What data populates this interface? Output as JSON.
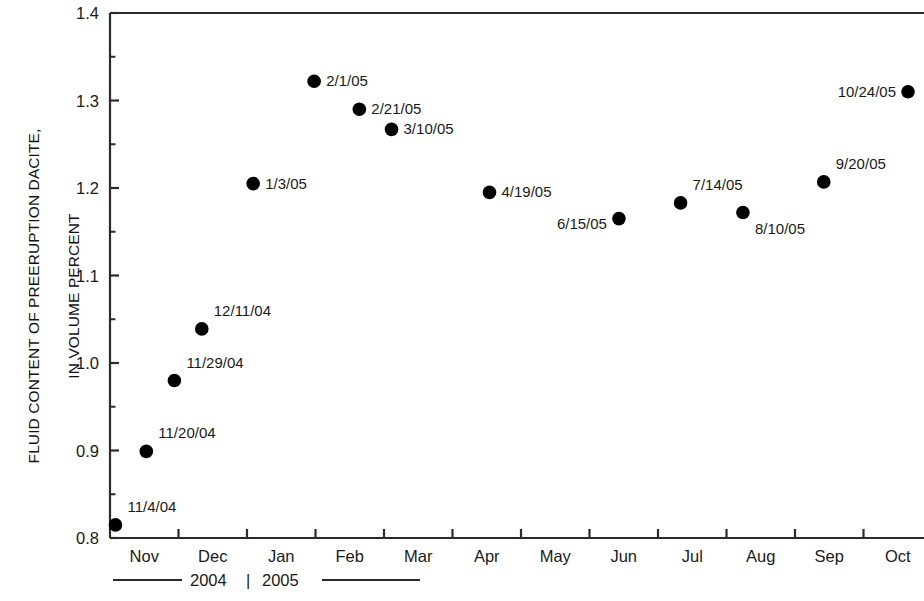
{
  "axes": {
    "y_title_line1": "FLUID CONTENT OF PREERUPTION DACITE,",
    "y_title_line2": "IN VOLUME PERCENT",
    "y_ticks": [
      "1.4",
      "1.3",
      "1.2",
      "1.1",
      "1.0",
      "0.9",
      "0.8"
    ],
    "x_ticks": [
      "Nov",
      "Dec",
      "Jan",
      "Feb",
      "Mar",
      "Apr",
      "May",
      "Jun",
      "Jul",
      "Aug",
      "Sep",
      "Oct"
    ],
    "year_left": "2004",
    "year_separator": "|",
    "year_right": "2005"
  },
  "chart_data": {
    "type": "scatter",
    "title": "",
    "xlabel": "",
    "ylabel": "FLUID CONTENT OF PREERUPTION DACITE, IN VOLUME PERCENT",
    "ylim": [
      0.8,
      1.4
    ],
    "y_major_step": 0.1,
    "y_minor_step": 0.05,
    "grid": false,
    "legend": false,
    "x_categories": [
      "Nov",
      "Dec",
      "Jan",
      "Feb",
      "Mar",
      "Apr",
      "May",
      "Jun",
      "Jul",
      "Aug",
      "Sep",
      "Oct"
    ],
    "x_year_spans": [
      "2004",
      "2005"
    ],
    "marker": {
      "shape": "circle",
      "color": "#000000",
      "size": 9
    },
    "points": [
      {
        "label": "11/4/04",
        "month": "Nov",
        "x": 0.08,
        "y": 0.815,
        "label_pos": "above-right"
      },
      {
        "label": "11/20/04",
        "month": "Nov",
        "x": 0.53,
        "y": 0.899,
        "label_pos": "above-right"
      },
      {
        "label": "11/29/04",
        "month": "Nov",
        "x": 0.94,
        "y": 0.98,
        "label_pos": "above-right"
      },
      {
        "label": "12/11/04",
        "month": "Dec",
        "x": 1.34,
        "y": 1.039,
        "label_pos": "above-right"
      },
      {
        "label": "1/3/05",
        "month": "Jan",
        "x": 2.09,
        "y": 1.205,
        "label_pos": "right"
      },
      {
        "label": "2/1/05",
        "month": "Feb",
        "x": 2.98,
        "y": 1.322,
        "label_pos": "right"
      },
      {
        "label": "2/21/05",
        "month": "Feb",
        "x": 3.64,
        "y": 1.29,
        "label_pos": "right"
      },
      {
        "label": "3/10/05",
        "month": "Mar",
        "x": 4.11,
        "y": 1.267,
        "label_pos": "right"
      },
      {
        "label": "4/19/05",
        "month": "Apr",
        "x": 5.54,
        "y": 1.195,
        "label_pos": "right"
      },
      {
        "label": "6/15/05",
        "month": "Jun",
        "x": 7.43,
        "y": 1.165,
        "label_pos": "below-left"
      },
      {
        "label": "7/14/05",
        "month": "Jul",
        "x": 8.33,
        "y": 1.183,
        "label_pos": "above-right"
      },
      {
        "label": "8/10/05",
        "month": "Aug",
        "x": 9.24,
        "y": 1.172,
        "label_pos": "below-right"
      },
      {
        "label": "9/20/05",
        "month": "Sep",
        "x": 10.42,
        "y": 1.207,
        "label_pos": "above-right"
      },
      {
        "label": "10/24/05",
        "month": "Oct",
        "x": 11.65,
        "y": 1.31,
        "label_pos": "left"
      }
    ]
  }
}
